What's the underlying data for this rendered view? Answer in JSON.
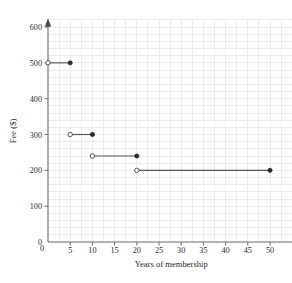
{
  "chart_data": {
    "type": "line",
    "title": "",
    "xlabel": "Years of membership",
    "ylabel": "Fee ($)",
    "xlim": [
      0,
      55
    ],
    "ylim": [
      0,
      620
    ],
    "grid": true,
    "legend": "none",
    "xticks": [
      0,
      5,
      10,
      15,
      20,
      25,
      30,
      35,
      40,
      45,
      50
    ],
    "xtick_labels": [
      "0",
      "5",
      "10",
      "15",
      "20",
      "25",
      "30",
      "35",
      "40",
      "45",
      "50"
    ],
    "yticks": [
      0,
      100,
      200,
      300,
      400,
      500,
      600
    ],
    "ytick_labels": [
      "0",
      "100",
      "200",
      "300",
      "400",
      "500",
      "600"
    ],
    "steps": [
      {
        "x_start": 0,
        "x_end": 5,
        "y": 500,
        "start_closed": false,
        "end_closed": true
      },
      {
        "x_start": 5,
        "x_end": 10,
        "y": 300,
        "start_closed": false,
        "end_closed": true
      },
      {
        "x_start": 10,
        "x_end": 20,
        "y": 240,
        "start_closed": false,
        "end_closed": true
      },
      {
        "x_start": 20,
        "x_end": 50,
        "y": 200,
        "start_closed": false,
        "end_closed": true
      }
    ],
    "points_open": [
      [
        0,
        500
      ],
      [
        5,
        300
      ],
      [
        10,
        240
      ],
      [
        20,
        200
      ]
    ],
    "points_closed": [
      [
        5,
        500
      ],
      [
        10,
        300
      ],
      [
        20,
        240
      ],
      [
        50,
        200
      ]
    ],
    "colors": {
      "line": "#555555",
      "point_fill_closed": "#2a2a2a",
      "point_fill_open": "#ffffff",
      "point_stroke": "#4d4d4d",
      "axis": "#6b6b6b",
      "grid": "#ececed",
      "text": "#1f1f1f",
      "background": "#ffffff"
    }
  }
}
